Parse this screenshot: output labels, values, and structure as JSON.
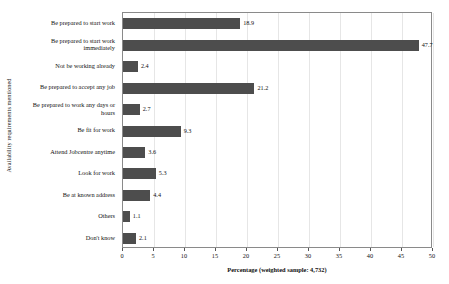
{
  "chart_data": {
    "type": "bar",
    "orientation": "horizontal",
    "title": "",
    "xlabel": "Percentage (weighted sample: 4,732)",
    "ylabel": "Availability requirements mentioned",
    "xlim": [
      0,
      50
    ],
    "xticks": [
      0,
      5,
      10,
      15,
      20,
      25,
      30,
      35,
      40,
      45,
      50
    ],
    "xtick_labels": [
      "0",
      "5",
      "10",
      "15",
      "20",
      "25",
      "30",
      "35",
      "40",
      "45",
      "50"
    ],
    "grid": "vertical-light",
    "legend": "none",
    "bar_color": "#4d4d4d",
    "categories": [
      "Be prepared to start work",
      "Be prepared to start work immediately",
      "Not be working already",
      "Be prepared to accept any job",
      "Be prepared to work any days or hours",
      "Be fit for work",
      "Attend Jobcentre anytime",
      "Look for work",
      "Be at known address",
      "Others",
      "Don't know"
    ],
    "category_lines": [
      [
        "Be prepared to start work"
      ],
      [
        "Be prepared to start work",
        "immediately"
      ],
      [
        "Not be working already"
      ],
      [
        "Be prepared to accept any job"
      ],
      [
        "Be prepared to work any days or",
        "hours"
      ],
      [
        "Be fit for work"
      ],
      [
        "Attend Jobcentre anytime"
      ],
      [
        "Look for work"
      ],
      [
        "Be at known address"
      ],
      [
        "Others"
      ],
      [
        "Don't know"
      ]
    ],
    "values": [
      18.9,
      47.7,
      2.4,
      21.2,
      2.7,
      9.3,
      3.6,
      5.3,
      4.4,
      1.1,
      2.1
    ],
    "value_labels": [
      "18.9",
      "47.7",
      "2.4",
      "21.2",
      "2.7",
      "9.3",
      "3.6",
      "5.3",
      "4.4",
      "1.1",
      "2.1"
    ]
  }
}
